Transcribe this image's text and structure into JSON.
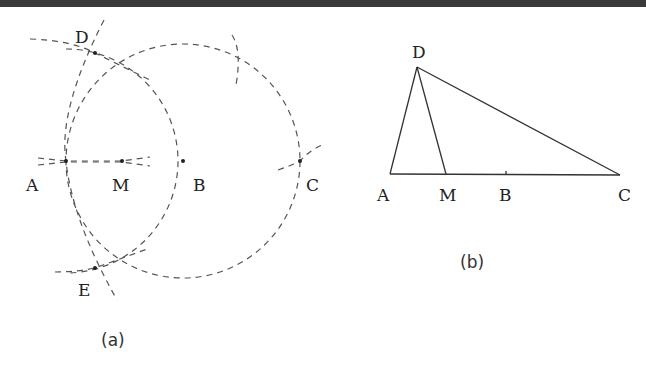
{
  "figure_a": {
    "caption": "(a)",
    "points": {
      "A": {
        "label": "A",
        "x": 66,
        "y": 161
      },
      "M": {
        "label": "M",
        "x": 122,
        "y": 161
      },
      "B": {
        "label": "B",
        "x": 183,
        "y": 161
      },
      "C": {
        "label": "C",
        "x": 300,
        "y": 161
      },
      "D": {
        "label": "D",
        "x": 95,
        "y": 53
      },
      "E": {
        "label": "E",
        "x": 95,
        "y": 268
      }
    },
    "constructions": [
      "circle centered at B through A and C (dashed)",
      "arc centered at A with radius AB through D and E (dashed)",
      "arcs centered at D and E intersecting (dashed)",
      "line through A, M, B (dashed)"
    ]
  },
  "figure_b": {
    "caption": "(b)",
    "points": {
      "A": {
        "label": "A",
        "x": 390,
        "y": 174
      },
      "M": {
        "label": "M",
        "x": 446,
        "y": 174
      },
      "B": {
        "label": "B",
        "x": 506,
        "y": 174
      },
      "C": {
        "label": "C",
        "x": 620,
        "y": 175
      },
      "D": {
        "label": "D",
        "x": 417,
        "y": 67
      }
    },
    "segments": [
      "AC",
      "AD",
      "DM",
      "DC"
    ]
  }
}
